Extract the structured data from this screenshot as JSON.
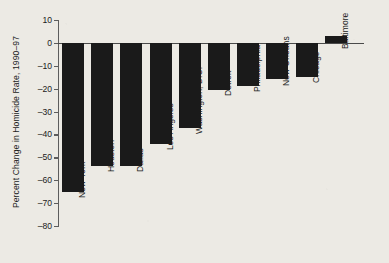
{
  "chart_data": {
    "type": "bar",
    "title": "",
    "xlabel": "",
    "ylabel": "Percent Change in Homicide Rate, 1990–97",
    "ylim": [
      -80,
      10
    ],
    "yticks": [
      10,
      0,
      -10,
      -20,
      -30,
      -40,
      -50,
      -60,
      -70,
      -80
    ],
    "ytick_labels": [
      "10",
      "0",
      "–10",
      "–20",
      "–30",
      "–40",
      "–50",
      "–60",
      "–70",
      "–80"
    ],
    "grid": false,
    "legend": false,
    "bar_color": "#1a1a1a",
    "background_color": "#eceae4",
    "axis_color": "#5d5d5d",
    "categories": [
      "New York",
      "Houston",
      "Dallas",
      "Los Angeles",
      "Washington, D.C.",
      "Detroit",
      "Philadelphia",
      "New Orleans",
      "Chicago",
      "Baltimore"
    ],
    "values": [
      -65,
      -54,
      -54,
      -44,
      -37,
      -20.5,
      -19,
      -16,
      -15,
      3
    ]
  },
  "axis": {
    "y_title": "Percent Change in Homicide Rate, 1990–97"
  }
}
